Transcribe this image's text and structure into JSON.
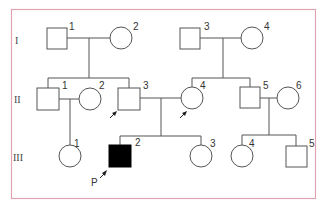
{
  "diagram": {
    "type": "pedigree",
    "frame_color": "#e2a3b3",
    "generations": [
      {
        "label": "I",
        "y": 40
      },
      {
        "label": "II",
        "y": 99
      },
      {
        "label": "III",
        "y": 157
      }
    ],
    "individuals": [
      {
        "id": "I-1",
        "gen": "I",
        "num": "1",
        "sex": "male",
        "affected": false
      },
      {
        "id": "I-2",
        "gen": "I",
        "num": "2",
        "sex": "female",
        "affected": false
      },
      {
        "id": "I-3",
        "gen": "I",
        "num": "3",
        "sex": "male",
        "affected": false
      },
      {
        "id": "I-4",
        "gen": "I",
        "num": "4",
        "sex": "female",
        "affected": false
      },
      {
        "id": "II-1",
        "gen": "II",
        "num": "1",
        "sex": "male",
        "affected": false
      },
      {
        "id": "II-2",
        "gen": "II",
        "num": "2",
        "sex": "female",
        "affected": false
      },
      {
        "id": "II-3",
        "gen": "II",
        "num": "3",
        "sex": "male",
        "affected": false,
        "arrow": true
      },
      {
        "id": "II-4",
        "gen": "II",
        "num": "4",
        "sex": "female",
        "affected": false,
        "arrow": true
      },
      {
        "id": "II-5",
        "gen": "II",
        "num": "5",
        "sex": "male",
        "affected": false
      },
      {
        "id": "II-6",
        "gen": "II",
        "num": "6",
        "sex": "female",
        "affected": false
      },
      {
        "id": "III-1",
        "gen": "III",
        "num": "1",
        "sex": "female",
        "affected": false
      },
      {
        "id": "III-2",
        "gen": "III",
        "num": "2",
        "sex": "male",
        "affected": true,
        "proband": true
      },
      {
        "id": "III-3",
        "gen": "III",
        "num": "3",
        "sex": "female",
        "affected": false
      },
      {
        "id": "III-4",
        "gen": "III",
        "num": "4",
        "sex": "female",
        "affected": false
      },
      {
        "id": "III-5",
        "gen": "III",
        "num": "5",
        "sex": "male",
        "affected": false
      }
    ],
    "proband_label": "P"
  }
}
